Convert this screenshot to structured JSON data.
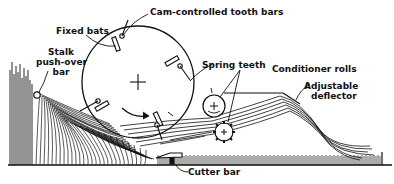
{
  "diagram": {
    "type": "mechanical-schematic",
    "labels": {
      "cam_controlled_tooth_bars": "Cam-controlled tooth bars",
      "fixed_bats": "Fixed bats",
      "stalk_pushover_line1": "Stalk",
      "stalk_pushover_line2": "push-over",
      "stalk_pushover_line3": "bar",
      "spring_teeth": "Spring teeth",
      "conditioner_rolls": "Conditioner rolls",
      "adjustable_line1": "Adjustable",
      "adjustable_line2": "deflector",
      "cutter_bar": "Cutter bar"
    },
    "components": [
      "reel-drum",
      "cam-controlled-tooth-bars",
      "fixed-bats",
      "spring-teeth",
      "stalk-push-over-bar",
      "conditioner-rolls",
      "adjustable-deflector",
      "cutter-bar",
      "crop-stalks",
      "ground-stubble"
    ],
    "colors": {
      "ink": "#111111",
      "background": "#ffffff"
    }
  }
}
